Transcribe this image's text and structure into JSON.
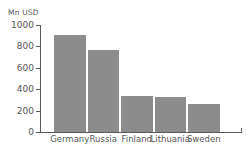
{
  "chart_data": {
    "type": "bar",
    "title": "",
    "subtitle": "",
    "xlabel": "",
    "ylabel": "Mn USD",
    "categories": [
      "Germany",
      "Russia",
      "Finland",
      "Lithuania",
      "Sweden"
    ],
    "values": [
      905,
      765,
      335,
      325,
      260
    ],
    "ylim": [
      0,
      1000
    ],
    "yticks": [
      0,
      200,
      400,
      600,
      800,
      1000
    ],
    "ytick_labels": [
      "0",
      "200",
      "400",
      "600",
      "800",
      "1000"
    ],
    "grid": false,
    "legend": false,
    "legend_position": "none",
    "series": [
      {
        "name": "Mn USD",
        "values": [
          905,
          765,
          335,
          325,
          260
        ],
        "color": "#8c8c8c"
      }
    ],
    "colors": {
      "bar": "#8c8c8c",
      "axis": "#5a5a5a",
      "text": "#555555",
      "background": "#ffffff"
    }
  }
}
